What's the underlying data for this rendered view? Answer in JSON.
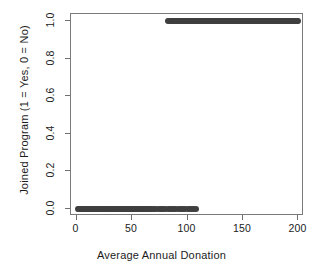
{
  "chart_data": {
    "type": "scatter",
    "title": "",
    "xlabel": "Average Annual Donation",
    "ylabel": "Joined Program (1 = Yes, 0 = No)",
    "xlim": [
      -5,
      205
    ],
    "ylim": [
      -0.04,
      1.04
    ],
    "xticks": [
      0,
      50,
      100,
      150,
      200
    ],
    "xticklabels": [
      "0",
      "50",
      "100",
      "150",
      "200"
    ],
    "yticks": [
      0.0,
      0.2,
      0.4,
      0.6,
      0.8,
      1.0
    ],
    "yticklabels": [
      "0.0",
      "0.2",
      "0.4",
      "0.6",
      "0.8",
      "1.0"
    ],
    "grid": false,
    "legend": null,
    "point_color": "#3f3f3f",
    "point_size": 6,
    "frame_color": "#7a7a7a",
    "series": [
      {
        "name": "Joined Program",
        "x": [
          1,
          2,
          3,
          4,
          5,
          6,
          7,
          8,
          9,
          10,
          11,
          12,
          13,
          14,
          15,
          16,
          17,
          18,
          19,
          20,
          21,
          22,
          23,
          24,
          25,
          26,
          27,
          28,
          29,
          30,
          31,
          32,
          33,
          34,
          35,
          36,
          37,
          38,
          39,
          40,
          41,
          42,
          43,
          44,
          45,
          46,
          47,
          48,
          49,
          50,
          51,
          52,
          53,
          54,
          55,
          56,
          57,
          58,
          59,
          60,
          61,
          62,
          63,
          64,
          65,
          66,
          68,
          70,
          72,
          74,
          76,
          78,
          80,
          82,
          84,
          86,
          88,
          90,
          92,
          94,
          96,
          98,
          100,
          102,
          104,
          106,
          108,
          82,
          84,
          85,
          86,
          87,
          88,
          89,
          90,
          91,
          92,
          93,
          94,
          95,
          96,
          97,
          98,
          99,
          100,
          101,
          102,
          103,
          104,
          105,
          106,
          107,
          108,
          109,
          110,
          111,
          112,
          113,
          114,
          115,
          116,
          117,
          118,
          119,
          120,
          121,
          122,
          123,
          124,
          125,
          126,
          127,
          128,
          129,
          130,
          131,
          132,
          133,
          134,
          135,
          136,
          137,
          138,
          139,
          140,
          141,
          142,
          143,
          144,
          145,
          146,
          147,
          148,
          149,
          150,
          151,
          152,
          153,
          154,
          155,
          156,
          157,
          158,
          159,
          160,
          161,
          162,
          163,
          164,
          165,
          166,
          167,
          168,
          169,
          170,
          171,
          172,
          173,
          174,
          175,
          176,
          177,
          178,
          179,
          180,
          181,
          182,
          183,
          184,
          185,
          186,
          187,
          188,
          189,
          190,
          191,
          192,
          193,
          194,
          195,
          196,
          197,
          198,
          199,
          200
        ],
        "y": [
          0,
          0,
          0,
          0,
          0,
          0,
          0,
          0,
          0,
          0,
          0,
          0,
          0,
          0,
          0,
          0,
          0,
          0,
          0,
          0,
          0,
          0,
          0,
          0,
          0,
          0,
          0,
          0,
          0,
          0,
          0,
          0,
          0,
          0,
          0,
          0,
          0,
          0,
          0,
          0,
          0,
          0,
          0,
          0,
          0,
          0,
          0,
          0,
          0,
          0,
          0,
          0,
          0,
          0,
          0,
          0,
          0,
          0,
          0,
          0,
          0,
          0,
          0,
          0,
          0,
          0,
          0,
          0,
          0,
          0,
          0,
          0,
          0,
          0,
          0,
          0,
          0,
          0,
          0,
          0,
          0,
          0,
          0,
          0,
          0,
          0,
          0,
          1,
          1,
          1,
          1,
          1,
          1,
          1,
          1,
          1,
          1,
          1,
          1,
          1,
          1,
          1,
          1,
          1,
          1,
          1,
          1,
          1,
          1,
          1,
          1,
          1,
          1,
          1,
          1,
          1,
          1,
          1,
          1,
          1,
          1,
          1,
          1,
          1,
          1,
          1,
          1,
          1,
          1,
          1,
          1,
          1,
          1,
          1,
          1,
          1,
          1,
          1,
          1,
          1,
          1,
          1,
          1,
          1,
          1,
          1,
          1,
          1,
          1,
          1,
          1,
          1,
          1,
          1,
          1,
          1,
          1,
          1,
          1,
          1,
          1,
          1,
          1,
          1,
          1,
          1,
          1,
          1,
          1,
          1,
          1,
          1,
          1,
          1,
          1,
          1,
          1,
          1,
          1,
          1,
          1,
          1,
          1,
          1,
          1,
          1,
          1,
          1,
          1,
          1,
          1,
          1,
          1,
          1,
          1,
          1,
          1,
          1,
          1,
          1,
          1,
          1,
          1,
          1,
          1
        ]
      }
    ]
  }
}
